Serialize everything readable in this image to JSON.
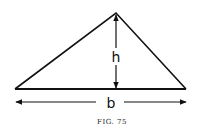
{
  "figure": {
    "caption": "FIG. 75",
    "height_label": "h",
    "base_label": "b",
    "shape": "triangle",
    "colors": {
      "stroke": "#111111",
      "background": "#ffffff"
    }
  }
}
